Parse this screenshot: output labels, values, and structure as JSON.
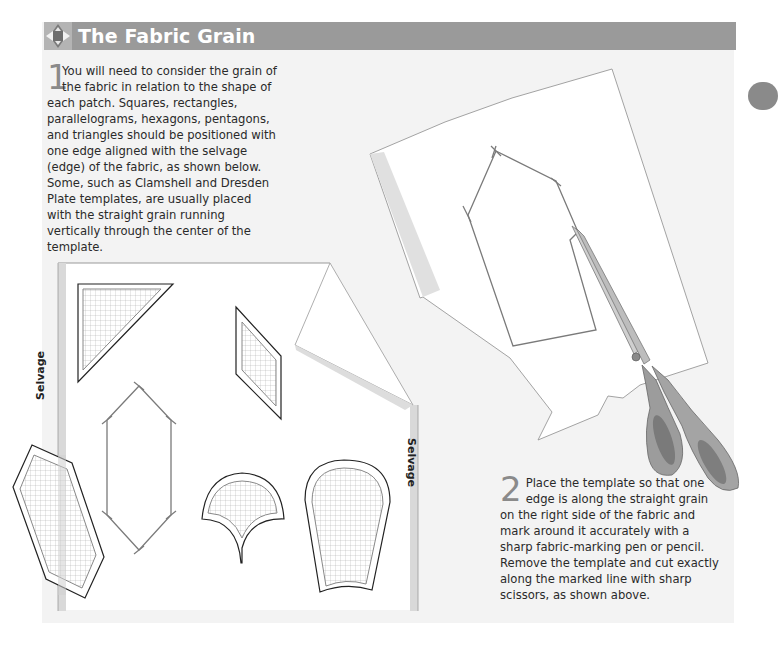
{
  "header": {
    "title": "The Fabric Grain",
    "icon": "quilt-star-block-icon"
  },
  "steps": [
    {
      "number": "1",
      "text": "You will need to consider the grain of the fabric in relation to the shape of each patch. Squares, rectangles, parallelograms, hexagons, pentagons, and triangles should be positioned with one edge aligned with the selvage (edge) of the fabric, as shown below. Some, such as Clamshell and Dresden Plate templates, are usually placed with the straight grain running vertically through the center of the template."
    },
    {
      "number": "2",
      "text": "Place the template so that one edge is along the straight grain on the right side of the fabric and mark around it accurately with a sharp fabric-marking pen or pencil. Remove the template and cut exactly along the marked line with sharp scissors, as shown above."
    }
  ],
  "illustration_left": {
    "labels": {
      "selvage_left": "Selvage",
      "selvage_right": "Selvage"
    },
    "shapes": [
      "triangle-template",
      "parallelogram-template",
      "hexagon-outline",
      "hexagon-template",
      "clamshell-template",
      "dresden-plate-template"
    ]
  },
  "illustration_right": {
    "shapes": [
      "fabric-piece",
      "hexagon-marked-outline",
      "scissors"
    ]
  },
  "colors": {
    "panel_bg": "#f3f3f3",
    "title_bar": "#9a9a9a",
    "step_number": "#8a8a8a",
    "side_tab": "#8a8a8a",
    "selvage_strip": "#d8d8d8",
    "scissors_handle": "#9a9a9a"
  }
}
